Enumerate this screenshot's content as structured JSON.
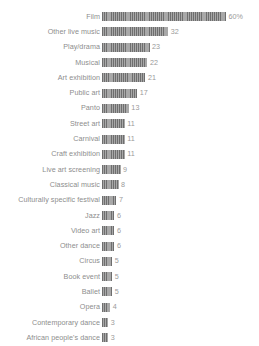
{
  "chart_data": {
    "type": "bar",
    "orientation": "horizontal",
    "title": "",
    "subtitle": "",
    "xlabel": "",
    "ylabel": "",
    "grid": false,
    "legend": null,
    "axis_visible": false,
    "xlim": [
      0,
      60
    ],
    "unit": "%",
    "bar_color": "#8f8f8f",
    "bar_pattern": "vertical-stripes",
    "label_color": "#8d8d8d",
    "value_color": "#9a9a9a",
    "background_color": "#ffffff",
    "categories": [
      "Film",
      "Other live music",
      "Play/drama",
      "Musical",
      "Art exhibition",
      "Public art",
      "Panto",
      "Street art",
      "Carnival",
      "Craft exhibition",
      "Live art screening",
      "Classical music",
      "Culturally specific festival",
      "Jazz",
      "Video art",
      "Other dance",
      "Circus",
      "Book event",
      "Ballet",
      "Opera",
      "Contemporary dance",
      "African people's dance"
    ],
    "values": [
      60,
      32,
      23,
      22,
      21,
      17,
      13,
      11,
      11,
      11,
      9,
      8,
      7,
      6,
      6,
      6,
      5,
      5,
      5,
      4,
      3,
      3
    ],
    "value_labels": [
      "60%",
      "32",
      "23",
      "22",
      "21",
      "17",
      "13",
      "11",
      "11",
      "11",
      "9",
      "8",
      "7",
      "6",
      "6",
      "6",
      "5",
      "5",
      "5",
      "4",
      "3",
      "3"
    ]
  },
  "rows": [
    {
      "label": "Film",
      "value": 60,
      "value_label": "60%"
    },
    {
      "label": "Other live music",
      "value": 32,
      "value_label": "32"
    },
    {
      "label": "Play/drama",
      "value": 23,
      "value_label": "23"
    },
    {
      "label": "Musical",
      "value": 22,
      "value_label": "22"
    },
    {
      "label": "Art exhibition",
      "value": 21,
      "value_label": "21"
    },
    {
      "label": "Public art",
      "value": 17,
      "value_label": "17"
    },
    {
      "label": "Panto",
      "value": 13,
      "value_label": "13"
    },
    {
      "label": "Street art",
      "value": 11,
      "value_label": "11"
    },
    {
      "label": "Carnival",
      "value": 11,
      "value_label": "11"
    },
    {
      "label": "Craft exhibition",
      "value": 11,
      "value_label": "11"
    },
    {
      "label": "Live art screening",
      "value": 9,
      "value_label": "9"
    },
    {
      "label": "Classical music",
      "value": 8,
      "value_label": "8"
    },
    {
      "label": "Culturally specific festival",
      "value": 7,
      "value_label": "7"
    },
    {
      "label": "Jazz",
      "value": 6,
      "value_label": "6"
    },
    {
      "label": "Video art",
      "value": 6,
      "value_label": "6"
    },
    {
      "label": "Other dance",
      "value": 6,
      "value_label": "6"
    },
    {
      "label": "Circus",
      "value": 5,
      "value_label": "5"
    },
    {
      "label": "Book event",
      "value": 5,
      "value_label": "5"
    },
    {
      "label": "Ballet",
      "value": 5,
      "value_label": "5"
    },
    {
      "label": "Opera",
      "value": 4,
      "value_label": "4"
    },
    {
      "label": "Contemporary dance",
      "value": 3,
      "value_label": "3"
    },
    {
      "label": "African people's dance",
      "value": 3,
      "value_label": "3"
    }
  ]
}
